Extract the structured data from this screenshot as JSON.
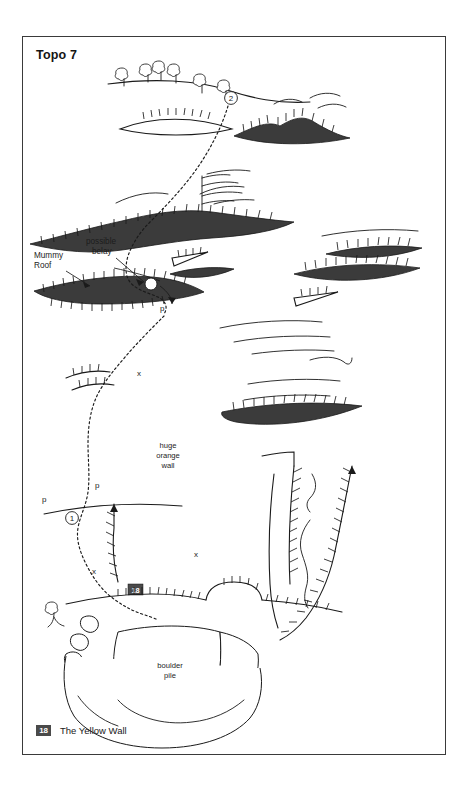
{
  "page": {
    "title": "Topo 7",
    "width": 468,
    "height": 792,
    "background_color": "#ffffff",
    "border_color": "#3a3a3a"
  },
  "legend": {
    "badge": "18",
    "label": "The Yellow Wall",
    "badge_bg": "#4a4a4a",
    "badge_text_color": "#ffffff"
  },
  "annotations": {
    "mummy_roof_line1": "Mummy",
    "mummy_roof_line2": "Roof",
    "possible_belay_line1": "possible",
    "possible_belay_line2": "belay",
    "huge_orange_wall_line1": "huge",
    "huge_orange_wall_line2": "orange",
    "huge_orange_wall_line3": "wall",
    "boulder_pile_line1": "boulder",
    "boulder_pile_line2": "pile",
    "route_badge": "18"
  },
  "markers": {
    "pitch_2": "2",
    "pitch_1": "1",
    "pendulum_upper": "p",
    "pendulum_mid": "p",
    "pendulum_lower": "p",
    "bolt_upper": "x",
    "bolt_mid": "x",
    "bolt_lower": "x"
  },
  "colors": {
    "ink": "#1a1a1a",
    "roof_fill": "#3b3b3b",
    "paper": "#ffffff"
  }
}
